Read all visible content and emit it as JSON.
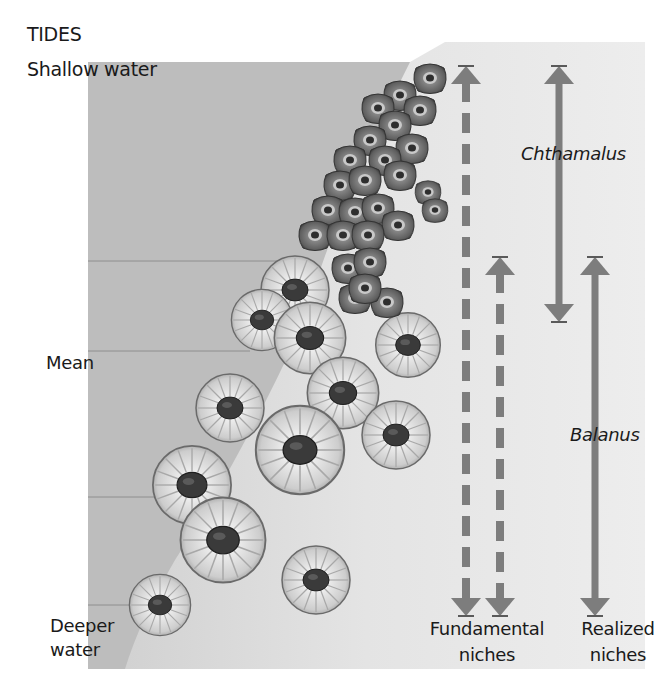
{
  "diagram": {
    "title": "TIDES",
    "tide_levels": {
      "top": "Shallow water",
      "middle": "Mean",
      "bottom_line1": "Deeper",
      "bottom_line2": "water"
    },
    "species": {
      "upper": "Chthamalus",
      "lower": "Balanus"
    },
    "niche_labels": {
      "fundamental_line1": "Fundamental",
      "fundamental_line2": "niches",
      "realized_line1": "Realized",
      "realized_line2": "niches"
    },
    "arrows": [
      {
        "name": "chthamalus-fundamental-niche",
        "style": "dashed",
        "x": 466,
        "y_top": 66,
        "y_bottom": 615
      },
      {
        "name": "balanus-fundamental-niche",
        "style": "dashed",
        "x": 500,
        "y_top": 257,
        "y_bottom": 615
      },
      {
        "name": "chthamalus-realized-niche",
        "style": "solid",
        "x": 559,
        "y_top": 66,
        "y_bottom": 320
      },
      {
        "name": "balanus-realized-niche",
        "style": "solid",
        "x": 595,
        "y_top": 257,
        "y_bottom": 615
      }
    ],
    "colors": {
      "water": "#bdbdbd",
      "rock": "#e2e2e2",
      "arrow": "#7d7d7d",
      "text": "#1a1a1a",
      "chthamalus_shell": "#6f6f6f",
      "balanus_shell": "#dcdcdc"
    }
  }
}
